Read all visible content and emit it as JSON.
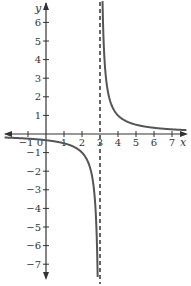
{
  "chart_data": {
    "type": "line",
    "title": "",
    "xlabel": "x",
    "ylabel": "y",
    "xlim": [
      -2.3,
      7.8
    ],
    "ylim": [
      -7.7,
      7.0
    ],
    "grid": false,
    "x_ticks": [
      -1,
      0,
      1,
      2,
      3,
      4,
      5,
      6,
      7
    ],
    "x_tick_labels": [
      "−1",
      "0",
      "1",
      "2",
      "3",
      "4",
      "5",
      "6",
      "7"
    ],
    "y_ticks": [
      6,
      5,
      4,
      3,
      2,
      1,
      -1,
      -2,
      -3,
      -4,
      -5,
      -6,
      -7
    ],
    "y_tick_labels": [
      "6",
      "5",
      "4",
      "3",
      "2",
      "1",
      "−1",
      "−2",
      "−3",
      "−4",
      "−5",
      "−6",
      "−7"
    ],
    "series": [
      {
        "name": "y = 1/(x − 3)",
        "function": "1/(x-3)",
        "branches": [
          {
            "x": [
              -2.3,
              -1,
              0,
              1,
              2,
              2.5,
              2.75,
              2.87
            ],
            "y": [
              -0.19,
              -0.25,
              -0.33,
              -0.5,
              -1,
              -2,
              -4,
              -7.7
            ]
          },
          {
            "x": [
              3.14,
              3.25,
              3.5,
              4,
              5,
              6,
              7,
              7.8
            ],
            "y": [
              7.0,
              4,
              2,
              1,
              0.5,
              0.33,
              0.25,
              0.21
            ]
          }
        ]
      }
    ],
    "asymptotes": [
      {
        "type": "vertical",
        "x": 3,
        "style": "dashed"
      },
      {
        "type": "horizontal",
        "y": 0
      }
    ],
    "colors": {
      "curve": "#555555",
      "axes": "#333333",
      "asymptote": "#555555"
    }
  }
}
